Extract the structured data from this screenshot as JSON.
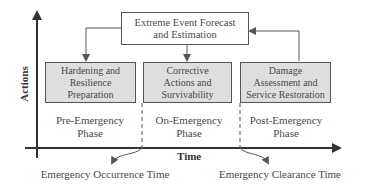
{
  "diagram": {
    "top_box": {
      "line1": "Extreme Event Forecast",
      "line2": "and Estimation"
    },
    "phase_boxes": [
      {
        "line1": "Hardening and",
        "line2": "Resilience",
        "line3": "Preparation"
      },
      {
        "line1": "Corrective",
        "line2": "Actions and",
        "line3": "Survivability"
      },
      {
        "line1": "Damage",
        "line2": "Assessment and",
        "line3": "Service Restoration"
      }
    ],
    "phases": [
      {
        "line1": "Pre-Emergency",
        "line2": "Phase"
      },
      {
        "line1": "On-Emergency",
        "line2": "Phase"
      },
      {
        "line1": "Post-Emergency",
        "line2": "Phase"
      }
    ],
    "axes": {
      "y_label": "Actions",
      "x_label": "Time"
    },
    "markers": {
      "occurrence": "Emergency Occurrence Time",
      "clearance": "Emergency Clearance Time"
    },
    "colors": {
      "box_fill": "#dedede",
      "line": "#555555",
      "text": "#4a4a4a"
    }
  }
}
